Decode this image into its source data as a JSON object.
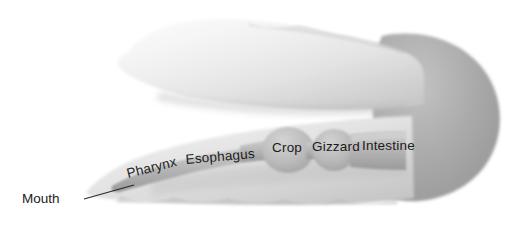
{
  "figure": {
    "background_color": "#ffffff"
  },
  "colors": {
    "body_light": "#ececec",
    "body_midlight": "#d9d9d9",
    "body_shadow": "#bdbdbd",
    "posterior_mass": "#a8a8a8",
    "tract_light": "#d2d2d2",
    "tract_mid": "#b6b6b6",
    "tract_dark": "#9d9d9d",
    "label_text": "#1b1b1b",
    "leader_line": "#2a2a2a"
  },
  "organ_labels": [
    {
      "id": "pharynx",
      "text": "Pharynx",
      "x": 128,
      "y": 178,
      "rotation": -14
    },
    {
      "id": "esophagus",
      "text": "Esophagus",
      "x": 186,
      "y": 164,
      "rotation": -5
    },
    {
      "id": "crop",
      "text": "Crop",
      "x": 272,
      "y": 152,
      "rotation": 0
    },
    {
      "id": "gizzard",
      "text": "Gizzard",
      "x": 312,
      "y": 151,
      "rotation": 0
    },
    {
      "id": "intestine",
      "text": "Intestine",
      "x": 362,
      "y": 150,
      "rotation": 0
    }
  ],
  "callouts": [
    {
      "id": "mouth",
      "text": "Mouth",
      "label_x": 22,
      "label_y": 203,
      "line_from_x": 84,
      "line_from_y": 199,
      "line_to_x": 134,
      "line_to_y": 185
    }
  ]
}
